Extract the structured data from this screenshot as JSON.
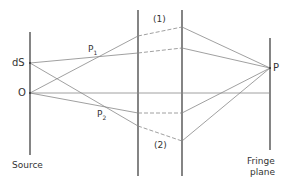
{
  "diagram": {
    "labels": {
      "ds": "dS",
      "o": "O",
      "p1": "P",
      "p1_sub": "1",
      "p2": "P",
      "p2_sub": "2",
      "path1": "(1)",
      "path2": "(2)",
      "p": "P",
      "source": "Source",
      "fringe_line1": "Fringe",
      "fringe_line2": "plane"
    },
    "colors": {
      "line": "#333333",
      "ray": "#888888",
      "background": "#ffffff"
    }
  }
}
